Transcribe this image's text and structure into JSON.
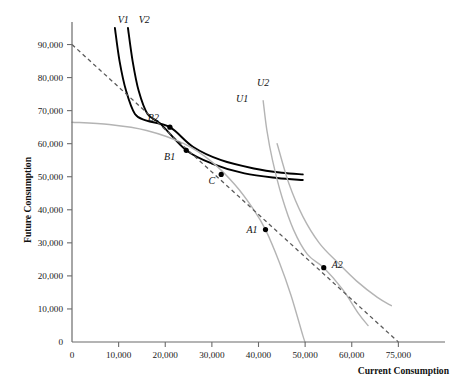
{
  "chart_data": {
    "type": "line",
    "title": "",
    "xlabel": "Current Consumption",
    "ylabel": "Future Consumption",
    "xlim": [
      0,
      80000
    ],
    "ylim": [
      0,
      95000
    ],
    "grid": false,
    "legend": "inline-curve-labels",
    "x_ticks": [
      {
        "value": 0,
        "label": "0"
      },
      {
        "value": 10000,
        "label": "10,000"
      },
      {
        "value": 20000,
        "label": "20,000"
      },
      {
        "value": 30000,
        "label": "30,000"
      },
      {
        "value": 40000,
        "label": "40,000"
      },
      {
        "value": 50000,
        "label": "50,000"
      },
      {
        "value": 60000,
        "label": "60,000"
      },
      {
        "value": 70000,
        "label": "75,000"
      }
    ],
    "y_ticks": [
      {
        "value": 0,
        "label": "0"
      },
      {
        "value": 10000,
        "label": "10,000"
      },
      {
        "value": 20000,
        "label": "20,000"
      },
      {
        "value": 30000,
        "label": "30,000"
      },
      {
        "value": 40000,
        "label": "40,000"
      },
      {
        "value": 50000,
        "label": "50,000"
      },
      {
        "value": 60000,
        "label": "60,000"
      },
      {
        "value": 70000,
        "label": "70,000"
      },
      {
        "value": 80000,
        "label": "80,000"
      },
      {
        "value": 90000,
        "label": "90,000"
      }
    ],
    "series": [
      {
        "name": "V1",
        "label": "V1",
        "color": "#000000",
        "style": "solid",
        "label_point": {
          "x": 11000,
          "y": 96500
        },
        "points": [
          {
            "x": 9200,
            "y": 95000
          },
          {
            "x": 10200,
            "y": 85000
          },
          {
            "x": 11600,
            "y": 76000
          },
          {
            "x": 13500,
            "y": 69000
          },
          {
            "x": 16000,
            "y": 67000
          },
          {
            "x": 21000,
            "y": 65000
          },
          {
            "x": 26000,
            "y": 59000
          },
          {
            "x": 32000,
            "y": 55000
          },
          {
            "x": 39000,
            "y": 52500
          },
          {
            "x": 45000,
            "y": 51200
          },
          {
            "x": 49500,
            "y": 50700
          }
        ]
      },
      {
        "name": "V2",
        "label": "V2",
        "color": "#000000",
        "style": "solid",
        "label_point": {
          "x": 15500,
          "y": 96500
        },
        "points": [
          {
            "x": 12000,
            "y": 95000
          },
          {
            "x": 13000,
            "y": 85000
          },
          {
            "x": 14300,
            "y": 76000
          },
          {
            "x": 16200,
            "y": 69000
          },
          {
            "x": 19000,
            "y": 66000
          },
          {
            "x": 24500,
            "y": 58000
          },
          {
            "x": 30000,
            "y": 54000
          },
          {
            "x": 37000,
            "y": 51000
          },
          {
            "x": 44000,
            "y": 49600
          },
          {
            "x": 49500,
            "y": 49000
          }
        ]
      },
      {
        "name": "U1",
        "label": "U1",
        "color": "#b4b4b4",
        "style": "solid",
        "label_point": {
          "x": 36500,
          "y": 72500
        },
        "points": [
          {
            "x": 0,
            "y": 66500
          },
          {
            "x": 8000,
            "y": 65800
          },
          {
            "x": 16000,
            "y": 64000
          },
          {
            "x": 24000,
            "y": 60000
          },
          {
            "x": 30000,
            "y": 54500
          },
          {
            "x": 35000,
            "y": 47500
          },
          {
            "x": 39000,
            "y": 40000
          },
          {
            "x": 41500,
            "y": 34000
          },
          {
            "x": 44500,
            "y": 24000
          },
          {
            "x": 47000,
            "y": 14000
          },
          {
            "x": 49500,
            "y": 2000
          },
          {
            "x": 50000,
            "y": 0
          }
        ]
      },
      {
        "name": "U2",
        "label": "U2",
        "color": "#b4b4b4",
        "style": "solid",
        "label_point": {
          "x": 41000,
          "y": 77500
        },
        "points": [
          {
            "x": 41000,
            "y": 73000
          },
          {
            "x": 41800,
            "y": 64000
          },
          {
            "x": 43000,
            "y": 55000
          },
          {
            "x": 45000,
            "y": 44000
          },
          {
            "x": 47500,
            "y": 34000
          },
          {
            "x": 50500,
            "y": 26500
          },
          {
            "x": 54000,
            "y": 22500
          },
          {
            "x": 58000,
            "y": 16000
          },
          {
            "x": 61500,
            "y": 8500
          },
          {
            "x": 63500,
            "y": 5000
          }
        ]
      },
      {
        "name": "U2-outer",
        "label": "",
        "color": "#b4b4b4",
        "style": "solid",
        "label_point": null,
        "points": [
          {
            "x": 44000,
            "y": 60000
          },
          {
            "x": 46500,
            "y": 48000
          },
          {
            "x": 49500,
            "y": 38000
          },
          {
            "x": 53000,
            "y": 30000
          },
          {
            "x": 57000,
            "y": 24000
          },
          {
            "x": 61000,
            "y": 18500
          },
          {
            "x": 65500,
            "y": 13500
          },
          {
            "x": 68500,
            "y": 11000
          }
        ]
      },
      {
        "name": "Budget line",
        "label": "",
        "color": "#5a5a5a",
        "style": "dashed",
        "label_point": null,
        "points": [
          {
            "x": 0,
            "y": 90000
          },
          {
            "x": 70000,
            "y": 0
          }
        ]
      }
    ],
    "annotated_points": [
      {
        "label": "B2",
        "x": 21000,
        "y": 65000,
        "label_dx": -11,
        "label_dy": -6,
        "anchor": "end"
      },
      {
        "label": "B1",
        "x": 24500,
        "y": 58000,
        "label_dx": -11,
        "label_dy": 10,
        "anchor": "end"
      },
      {
        "label": "C",
        "x": 32000,
        "y": 50700,
        "label_dx": -6,
        "label_dy": 10,
        "anchor": "end"
      },
      {
        "label": "A1",
        "x": 41500,
        "y": 34000,
        "label_dx": -8,
        "label_dy": 3,
        "anchor": "end"
      },
      {
        "label": "A2",
        "x": 54000,
        "y": 22500,
        "label_dx": 8,
        "label_dy": 0,
        "anchor": "start"
      }
    ]
  },
  "axes": {
    "x_title": "Current Consumption",
    "y_title": "Future Consumption"
  }
}
